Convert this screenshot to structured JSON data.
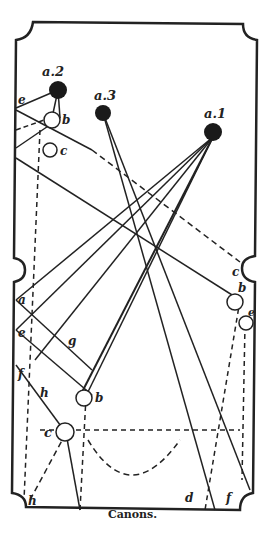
{
  "caption": "Canons.",
  "labels": {
    "a1": "a.1",
    "a2": "a.2",
    "a3": "a.3",
    "b_top": "b",
    "c_top": "c",
    "e_top": "e",
    "c_right": "c",
    "b_right": "b",
    "e_right": "e",
    "a_left": "a",
    "e_left": "e",
    "f_left": "f",
    "g": "g",
    "h_mid": "h",
    "b_bottom": "b",
    "c_bottom": "c",
    "h_bottom": "h",
    "d_bottom": "d",
    "f_bottom": "f"
  }
}
